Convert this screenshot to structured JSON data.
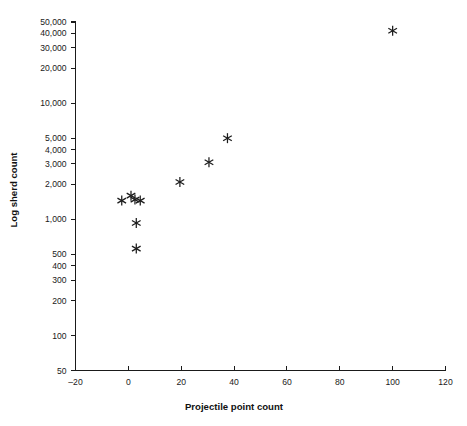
{
  "chart_data": {
    "type": "scatter",
    "title": "",
    "xlabel": "Projectile point count",
    "ylabel": "Log sherd count",
    "xlim": [
      -20,
      120
    ],
    "ylim": [
      50,
      50000
    ],
    "yscale": "log",
    "xscale": "linear",
    "grid": false,
    "legend": null,
    "marker_style": "asterisk",
    "marker_color": "#1c1c1c",
    "xticks": [
      -20,
      0,
      20,
      40,
      60,
      80,
      100,
      120
    ],
    "xticklabels": [
      "–20",
      "0",
      "20",
      "40",
      "60",
      "80",
      "100",
      "120"
    ],
    "yticks": [
      50,
      100,
      200,
      300,
      400,
      500,
      1000,
      2000,
      3000,
      4000,
      5000,
      10000,
      20000,
      30000,
      40000,
      50000
    ],
    "yticklabels": [
      "50",
      "100",
      "200",
      "300",
      "400",
      "500",
      "1,000",
      "2,000",
      "3,000",
      "4,000",
      "5,000",
      "10,000",
      "20,000",
      "30,000",
      "40,000",
      "50,000"
    ],
    "points": [
      {
        "x": -2.5,
        "y": 1450
      },
      {
        "x": 1.0,
        "y": 1600
      },
      {
        "x": 2.5,
        "y": 1480
      },
      {
        "x": 4.5,
        "y": 1450
      },
      {
        "x": 3.0,
        "y": 930
      },
      {
        "x": 3.0,
        "y": 560
      },
      {
        "x": 19.5,
        "y": 2100
      },
      {
        "x": 30.5,
        "y": 3100
      },
      {
        "x": 37.5,
        "y": 5000
      },
      {
        "x": 100.0,
        "y": 42000
      }
    ]
  }
}
